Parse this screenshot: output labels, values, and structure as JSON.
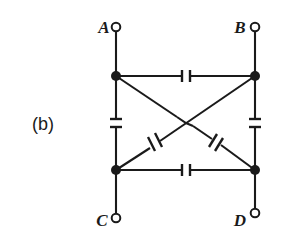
{
  "figure": {
    "part_label": "(b)",
    "type": "circuit-diagram",
    "stroke_color": "#1a1a1a",
    "background_color": "#ffffff",
    "node_fill_color": "#1a1a1a",
    "terminal_fill_color": "#ffffff"
  },
  "terminals": [
    {
      "id": "A",
      "label": "A",
      "label_x": 104,
      "label_y": 33,
      "circle_x": 116,
      "circle_y": 27,
      "node_x": 116,
      "node_y": 76
    },
    {
      "id": "B",
      "label": "B",
      "label_x": 234,
      "label_y": 33,
      "circle_x": 255,
      "circle_y": 27,
      "node_x": 255,
      "node_y": 76
    },
    {
      "id": "C",
      "label": "C",
      "label_x": 99,
      "label_y": 224,
      "circle_x": 116,
      "circle_y": 218,
      "node_x": 116,
      "node_y": 170
    },
    {
      "id": "D",
      "label": "D",
      "label_x": 236,
      "label_y": 224,
      "circle_x": 255,
      "circle_y": 218,
      "node_x": 255,
      "node_y": 170
    }
  ],
  "nodes": [
    {
      "id": "node-top-left",
      "x": 116,
      "y": 76
    },
    {
      "id": "node-top-right",
      "x": 255,
      "y": 76
    },
    {
      "id": "node-bottom-left",
      "x": 116,
      "y": 170
    },
    {
      "id": "node-bottom-right",
      "x": 255,
      "y": 170
    }
  ],
  "capacitors": [
    {
      "id": "cap-top",
      "between": "A-B",
      "orientation": "horizontal",
      "center_x": 186,
      "center_y": 76
    },
    {
      "id": "cap-bottom",
      "between": "C-D",
      "orientation": "horizontal",
      "center_x": 186,
      "center_y": 170
    },
    {
      "id": "cap-left",
      "between": "A-C",
      "orientation": "vertical",
      "center_x": 116,
      "center_y": 123
    },
    {
      "id": "cap-right",
      "between": "B-D",
      "orientation": "vertical",
      "center_x": 255,
      "center_y": 123
    },
    {
      "id": "cap-diagonal-left",
      "between": "C-B",
      "orientation": "diagonal",
      "center_x": 156,
      "center_y": 144
    },
    {
      "id": "cap-diagonal-right",
      "between": "A-D",
      "orientation": "diagonal",
      "center_x": 216,
      "center_y": 144
    }
  ],
  "wire_crossing": {
    "id": "wire-hop",
    "x": 185,
    "y": 123,
    "connected": false
  }
}
